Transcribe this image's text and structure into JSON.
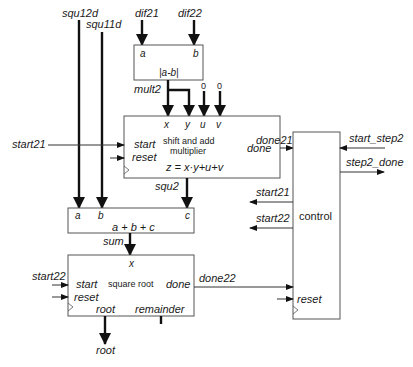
{
  "diagram": {
    "title": "",
    "blocks": {
      "abs_diff": {
        "inputs": [
          "a",
          "b"
        ],
        "function": "|a-b|",
        "output_label": "mult2"
      },
      "multiplier": {
        "inputs": [
          "x",
          "y",
          "u",
          "v"
        ],
        "ctrl_inputs": [
          "start",
          "reset"
        ],
        "title_line1": "shift and add",
        "title_line2": "multiplier",
        "equation": "z = x·y+u+v",
        "output_done": "done",
        "output_label": "squ2"
      },
      "adder": {
        "inputs": [
          "a",
          "b",
          "c"
        ],
        "function": "a + b + c",
        "output_label": "sum"
      },
      "sqrt": {
        "input": "x",
        "ctrl_inputs": [
          "start",
          "reset"
        ],
        "title": "square root",
        "output_done": "done",
        "outputs": [
          "root",
          "remainder"
        ]
      },
      "control": {
        "title": "control",
        "reset": "reset"
      }
    },
    "signals": {
      "squ12d": "squ12d",
      "squ11d": "squ11d",
      "dif21": "dif21",
      "dif22": "dif22",
      "zero_u": "0",
      "zero_v": "0",
      "start21_in": "start21",
      "done21": "done21",
      "start_step2": "start_step2",
      "step2_done": "step2_done",
      "start21_out": "start21",
      "start22_out": "start22",
      "start22_in": "start22",
      "done22": "done22",
      "root_out": "root"
    }
  }
}
